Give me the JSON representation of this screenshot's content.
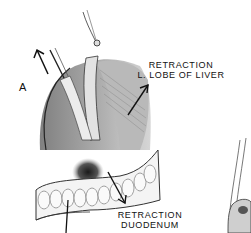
{
  "figure": {
    "panel_label": "A",
    "labels": {
      "liver_line1": "RETRACTION",
      "liver_line2": "L. LOBE OF LIVER",
      "duodenum_line1": "RETRACTION",
      "duodenum_line2": "DUODENUM"
    },
    "style": {
      "background": "#ffffff",
      "ink": "#111111",
      "shade_dark": "#3a3a3a",
      "shade_mid": "#8a8a8a",
      "shade_light": "#d6d6d6"
    }
  }
}
